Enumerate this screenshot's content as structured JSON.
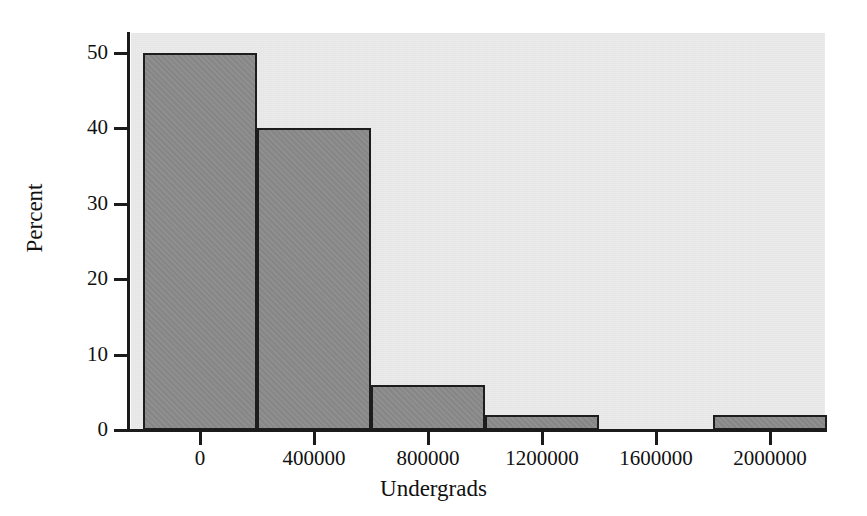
{
  "chart_data": {
    "type": "bar",
    "title": "",
    "xlabel": "Undergrads",
    "ylabel": "Percent",
    "categories": [
      "0",
      "400000",
      "800000",
      "1200000",
      "1600000",
      "2000000"
    ],
    "bin_width": 400000,
    "bin_edges": [
      -200000,
      200000,
      600000,
      1000000,
      1400000,
      1800000,
      2200000
    ],
    "values": [
      50,
      40,
      6,
      2,
      0,
      2
    ],
    "bars": [
      {
        "bin_start": -200000,
        "bin_end": 200000,
        "value": 50
      },
      {
        "bin_start": 200000,
        "bin_end": 600000,
        "value": 40
      },
      {
        "bin_start": 600000,
        "bin_end": 1000000,
        "value": 6
      },
      {
        "bin_start": 1000000,
        "bin_end": 1400000,
        "value": 2
      },
      {
        "bin_start": 1400000,
        "bin_end": 1800000,
        "value": 0
      },
      {
        "bin_start": 1800000,
        "bin_end": 2200000,
        "value": 2
      }
    ],
    "xticks": [
      0,
      400000,
      800000,
      1200000,
      1600000,
      2000000
    ],
    "xtick_labels": [
      "0",
      "400000",
      "800000",
      "1200000",
      "1600000",
      "2000000"
    ],
    "yticks": [
      0,
      10,
      20,
      30,
      40,
      50
    ],
    "ytick_labels": [
      "0",
      "10",
      "20",
      "30",
      "40",
      "50"
    ],
    "xlim": [
      -310000,
      2320000
    ],
    "ylim": [
      0,
      53
    ],
    "grid": false,
    "legend": null,
    "colors": {
      "bar_fill": "#8b8b8b",
      "bar_edge": "#1d1d1d",
      "plot_background": "#ebebeb",
      "figure_background": "#ffffff",
      "axis": "#1b1b1b",
      "text": "#111111"
    }
  }
}
